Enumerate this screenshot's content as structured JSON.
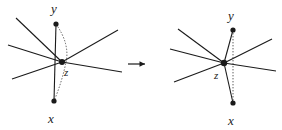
{
  "figure": {
    "type": "diagram",
    "background_color": "#ffffff",
    "ink_color": "#1a1a1a",
    "transform_symbol": "→",
    "panels": [
      {
        "id": "left-panel",
        "name": "before",
        "vertices": [
          {
            "id": "y",
            "label": "y",
            "cx": 56,
            "cy": 24,
            "r": 2.6
          },
          {
            "id": "z",
            "label": "z",
            "cx": 62,
            "cy": 62,
            "r": 3.0
          },
          {
            "id": "x",
            "label": "x",
            "cx": 54,
            "cy": 101,
            "r": 2.6
          }
        ],
        "labels": [
          {
            "for": "y",
            "text": "y",
            "x": 51,
            "y": 2,
            "size": "main"
          },
          {
            "for": "z",
            "text": "z",
            "x": 64,
            "y": 67,
            "size": "z"
          },
          {
            "for": "x",
            "text": "x",
            "x": 48,
            "y": 112,
            "size": "main"
          }
        ],
        "solid_edges": [
          {
            "from": [
              56,
              24
            ],
            "to": [
              54,
              101
            ],
            "name": "edge-y-x-vertical"
          },
          {
            "from": [
              62,
              62
            ],
            "to": [
              16,
              18
            ],
            "name": "edge-z-upper-left"
          },
          {
            "from": [
              62,
              62
            ],
            "to": [
              8,
              45
            ],
            "name": "edge-z-left"
          },
          {
            "from": [
              62,
              62
            ],
            "to": [
              12,
              79
            ],
            "name": "edge-z-lower-left"
          },
          {
            "from": [
              62,
              62
            ],
            "to": [
              118,
              30
            ],
            "name": "edge-z-upper-right"
          },
          {
            "from": [
              62,
              62
            ],
            "to": [
              122,
              72
            ],
            "name": "edge-z-lower-right"
          }
        ],
        "dotted_edges": [
          {
            "from": [
              56,
              24
            ],
            "via": [
              67,
              62
            ],
            "to": [
              54,
              101
            ],
            "name": "dotted-y-z-x"
          }
        ]
      },
      {
        "id": "right-panel",
        "name": "after",
        "vertices": [
          {
            "id": "y",
            "label": "y",
            "cx": 233,
            "cy": 30,
            "r": 2.6
          },
          {
            "id": "z",
            "label": "z",
            "cx": 224,
            "cy": 63,
            "r": 3.2
          },
          {
            "id": "x",
            "label": "x",
            "cx": 233,
            "cy": 103,
            "r": 2.6
          }
        ],
        "labels": [
          {
            "for": "y",
            "text": "y",
            "x": 228,
            "y": 9,
            "size": "main"
          },
          {
            "for": "z",
            "text": "z",
            "x": 214,
            "y": 70,
            "size": "z"
          },
          {
            "for": "x",
            "text": "x",
            "x": 228,
            "y": 114,
            "size": "main"
          }
        ],
        "solid_edges": [
          {
            "from": [
              224,
              63
            ],
            "to": [
              233,
              30
            ],
            "name": "edge-z-y"
          },
          {
            "from": [
              224,
              63
            ],
            "to": [
              233,
              103
            ],
            "name": "edge-z-x"
          },
          {
            "from": [
              224,
              63
            ],
            "to": [
              178,
              29
            ],
            "name": "edge-z-upper-left"
          },
          {
            "from": [
              224,
              63
            ],
            "to": [
              170,
              49
            ],
            "name": "edge-z-left"
          },
          {
            "from": [
              224,
              63
            ],
            "to": [
              174,
              82
            ],
            "name": "edge-z-lower-left"
          },
          {
            "from": [
              224,
              63
            ],
            "to": [
              272,
              39
            ],
            "name": "edge-z-upper-right"
          },
          {
            "from": [
              224,
              63
            ],
            "to": [
              276,
              71
            ],
            "name": "edge-z-lower-right"
          }
        ],
        "dotted_edges": [
          {
            "from": [
              233,
              30
            ],
            "via": [
              233,
              63
            ],
            "to": [
              233,
              103
            ],
            "name": "dotted-y-x-vertical"
          }
        ]
      }
    ],
    "arrow": {
      "x": 128,
      "y": 55,
      "text": "→"
    }
  }
}
